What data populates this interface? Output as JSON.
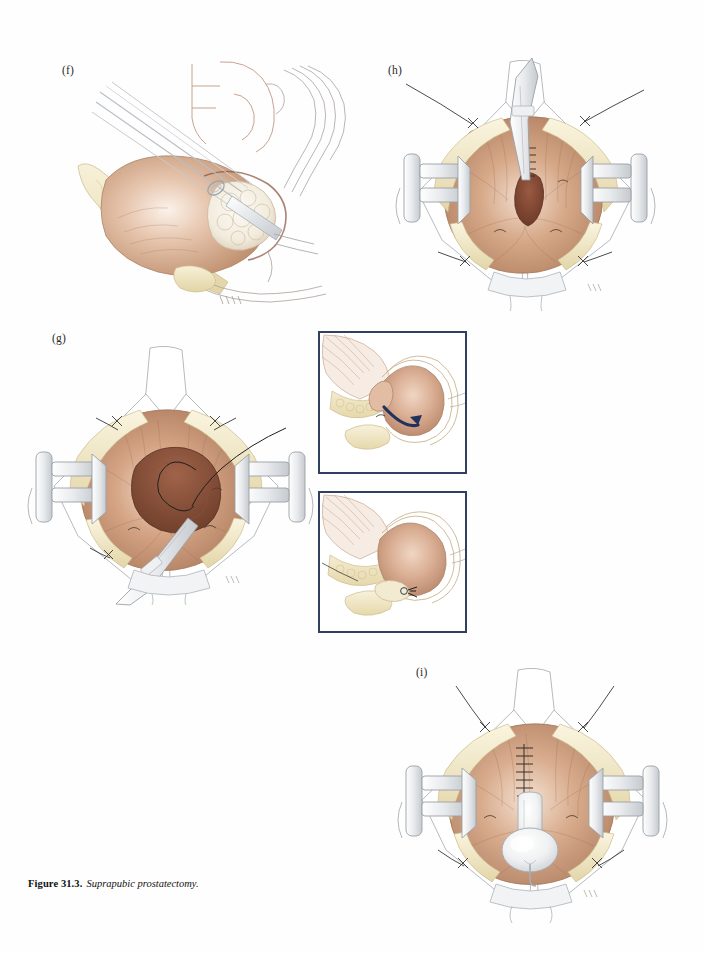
{
  "page": {
    "background_color": "#fefefe",
    "width": 703,
    "height": 953
  },
  "caption": {
    "number": "Figure 31.3.",
    "title": "Suprapubic prostatectomy."
  },
  "palette": {
    "tissue_mid": "#c49a7e",
    "tissue_light": "#e3c3ad",
    "tissue_deep": "#8d5a45",
    "fat_cream": "#f0e8c8",
    "fat_shadow": "#ded0a4",
    "instrument_gray": "#d8dade",
    "outline_gray": "#9aa0a6",
    "outline_brown": "#a9714f",
    "suture_dark": "#2b2b2b",
    "inset_border": "#31405f",
    "arrow_navy": "#22325c",
    "prostate_white": "#f4efe6"
  },
  "panels": [
    {
      "id": "f",
      "label": "(f)",
      "caption_role": "sagittal-section-enucleation",
      "label_x": 62,
      "label_y": 64,
      "x": 70,
      "y": 60,
      "width": 290,
      "height": 245,
      "elements": [
        "surgical-instrument-shaft",
        "bladder-wall",
        "prostate-adenoma",
        "pubic-bone",
        "rectum-outline",
        "periprostatic-fat"
      ]
    },
    {
      "id": "h",
      "label": "(h)",
      "caption_role": "bladder-neck-suture-placement",
      "label_x": 388,
      "label_y": 64,
      "x": 398,
      "y": 62,
      "width": 250,
      "height": 250,
      "elements": [
        "self-retaining-retractor-left",
        "self-retaining-retractor-right",
        "stay-suture-upper-left",
        "stay-suture-upper-right",
        "stay-suture-lower-left",
        "stay-suture-lower-right",
        "prostatic-fossa",
        "suture-line",
        "forceps"
      ]
    },
    {
      "id": "g",
      "label": "(g)",
      "caption_role": "open-bladder-suture-loop",
      "label_x": 55,
      "label_y": 333,
      "x": 28,
      "y": 345,
      "width": 280,
      "height": 260,
      "elements": [
        "self-retaining-retractor-left",
        "self-retaining-retractor-right",
        "open-bladder-cavity",
        "suture-loop",
        "needle-holder",
        "stay-suture-upper-left",
        "stay-suture-upper-right"
      ]
    },
    {
      "id": "i",
      "label": "(i)",
      "caption_role": "closed-bladder-with-foley",
      "label_x": 418,
      "label_y": 666,
      "x": 400,
      "y": 672,
      "width": 260,
      "height": 250,
      "elements": [
        "self-retaining-retractor-left",
        "self-retaining-retractor-right",
        "closed-suture-line",
        "foley-catheter",
        "foley-balloon",
        "stay-suture-upper-left",
        "stay-suture-upper-right"
      ]
    }
  ],
  "insets": [
    {
      "id": "inset-1",
      "x": 318,
      "y": 331,
      "width": 149,
      "height": 143,
      "border_color": "#31405f",
      "caption_role": "cross-section-with-traction-arrow",
      "annotation": "curved-navy-arrow",
      "elements": [
        "bladder-cross-section",
        "prostate-cavity",
        "pubic-symphysis",
        "traction-arrow"
      ]
    },
    {
      "id": "inset-2",
      "x": 318,
      "y": 491,
      "width": 149,
      "height": 142,
      "border_color": "#31405f",
      "caption_role": "cross-section-after-closure",
      "annotation": "suture-knot-marker",
      "elements": [
        "bladder-cross-section",
        "closed-bladder-neck",
        "pubic-symphysis",
        "suture-knot"
      ]
    }
  ]
}
